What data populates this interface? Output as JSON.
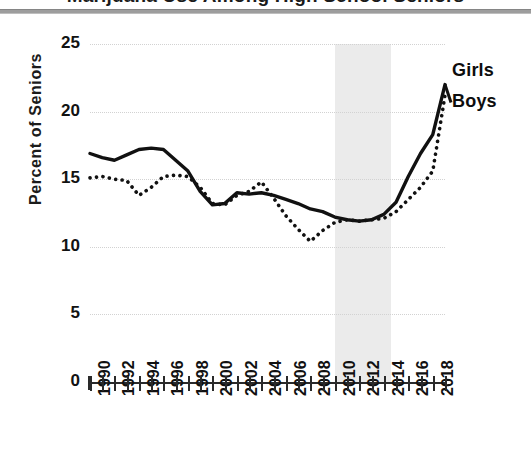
{
  "title": "Marijuana Use Among High School Seniors",
  "figure": {
    "ylabel": "Percent of Seniors",
    "ytick_labels": [
      "25",
      "20",
      "15",
      "10",
      "5",
      "0"
    ],
    "series_labels": {
      "girls": "Girls",
      "boys": "Boys"
    }
  },
  "chart_data": {
    "type": "line",
    "title": "",
    "xlabel": "",
    "ylabel": "Percent of Seniors",
    "ylim": [
      0,
      25
    ],
    "yticks": [
      0,
      5,
      10,
      15,
      20,
      25
    ],
    "xlim": [
      1990,
      2019
    ],
    "grid": true,
    "legend_position": "right-inline-labels",
    "x": [
      1990,
      1991,
      1992,
      1993,
      1994,
      1995,
      1996,
      1997,
      1998,
      1999,
      2000,
      2001,
      2002,
      2003,
      2004,
      2005,
      2006,
      2007,
      2008,
      2009,
      2010,
      2011,
      2012,
      2013,
      2014,
      2015,
      2016,
      2017,
      2018,
      2019
    ],
    "xtick_labels": [
      "1990",
      "1992",
      "1994",
      "1996",
      "1998",
      "2000",
      "2002",
      "2004",
      "2006",
      "2008",
      "2010",
      "2012",
      "2014",
      "2016",
      "2018"
    ],
    "series": [
      {
        "name": "Boys",
        "style": "solid",
        "color": "#111111",
        "values": [
          16.9,
          16.6,
          16.4,
          16.8,
          17.2,
          17.3,
          17.2,
          16.4,
          15.6,
          14.1,
          13.1,
          13.2,
          14.0,
          13.9,
          14.0,
          13.8,
          13.5,
          13.2,
          12.8,
          12.6,
          12.2,
          12.0,
          11.9,
          12.0,
          12.4,
          13.3,
          15.2,
          16.9,
          18.3,
          22.0
        ]
      },
      {
        "name": "Girls",
        "style": "dotted",
        "color": "#111111",
        "values": [
          15.1,
          15.2,
          15.0,
          14.9,
          13.8,
          14.4,
          15.2,
          15.3,
          15.2,
          14.4,
          13.2,
          13.1,
          13.8,
          14.1,
          14.8,
          13.6,
          12.3,
          11.3,
          10.4,
          11.2,
          11.8,
          12.0,
          11.9,
          12.0,
          12.1,
          12.6,
          13.5,
          14.4,
          15.6,
          21.2
        ]
      }
    ],
    "annotations": [
      {
        "type": "shaded-band",
        "label": "",
        "x_start": 2010,
        "x_end": 2014.6,
        "color": "#ebebeb"
      }
    ]
  }
}
